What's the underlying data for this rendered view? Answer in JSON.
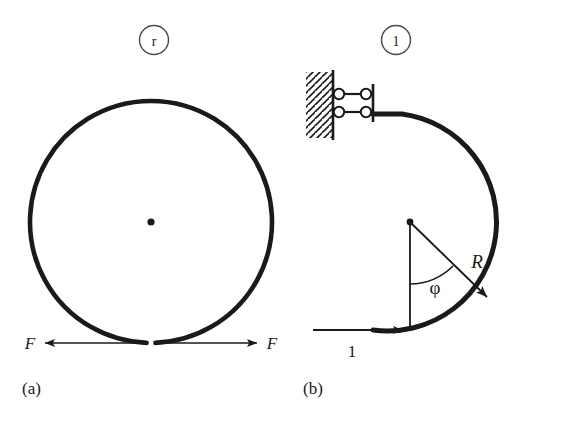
{
  "figure": {
    "title_panels": [
      "(a)",
      "(b)"
    ],
    "background_color": "#ffffff",
    "ink_color": "#1a1a1a"
  },
  "panel_a": {
    "caption": "(a)",
    "badge_label": "r",
    "center_label": "center-dot",
    "ring": {
      "center_x": 151,
      "center_y": 222,
      "radius": 121,
      "gap_degrees": 8,
      "description": "split-ring"
    },
    "force_left": {
      "label": "F",
      "direction": "left"
    },
    "force_right": {
      "label": "F",
      "direction": "right"
    }
  },
  "panel_b": {
    "caption": "(b)",
    "badge_label": "1",
    "arc": {
      "center_x": 410,
      "center_y": 222,
      "radius": 108,
      "start_angle_deg": 180,
      "end_angle_deg": 90,
      "description": "open-circular-arc"
    },
    "radius_label": "R",
    "angle_label": "φ",
    "load_label": "1",
    "support": {
      "type": "double-link-roller-support",
      "hatching": "diagonal",
      "pin_count": 4,
      "link_count": 2
    }
  },
  "colors": {
    "ink": "#1a1a1a",
    "thin_line": "#1a1a1a",
    "paper": "#ffffff"
  }
}
